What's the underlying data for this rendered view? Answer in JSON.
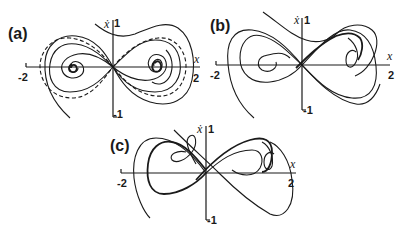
{
  "figure": {
    "panels": [
      {
        "label": "(a)",
        "x_axis": {
          "var": "x",
          "min_label": "-2",
          "max_label": "2"
        },
        "y_axis": {
          "var": "ẋ",
          "max_label": "1",
          "min_label": "-1"
        },
        "curve_styles": [
          "solid",
          "dashed"
        ]
      },
      {
        "label": "(b)",
        "x_axis": {
          "var": "x",
          "min_label": "-2",
          "max_label": "2"
        },
        "y_axis": {
          "var": "ẋ",
          "max_label": "1",
          "min_label": "-1"
        },
        "curve_styles": [
          "solid"
        ]
      },
      {
        "label": "(c)",
        "x_axis": {
          "var": "x",
          "min_label": "-2",
          "max_label": "2"
        },
        "y_axis": {
          "var": "ẋ",
          "max_label": "1",
          "min_label": "-1"
        },
        "curve_styles": [
          "solid"
        ]
      }
    ]
  },
  "colors": {
    "ink": "#1a1a1a",
    "background": "#ffffff"
  }
}
